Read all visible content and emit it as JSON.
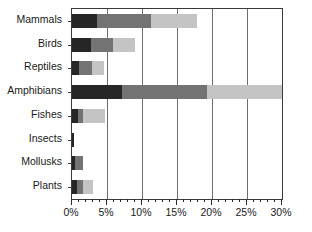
{
  "chart_data": {
    "type": "bar",
    "orientation": "horizontal",
    "stacked": true,
    "title": "",
    "xlabel": "",
    "ylabel": "",
    "xlim": [
      0,
      30
    ],
    "xtick_labels": [
      "0%",
      "5%",
      "10%",
      "15%",
      "20%",
      "25%",
      "30%"
    ],
    "xticks": [
      0,
      5,
      10,
      15,
      20,
      25,
      30
    ],
    "minor_tick_step": 1,
    "grid": "vertical",
    "legend": "none",
    "categories": [
      "Mammals",
      "Birds",
      "Reptiles",
      "Amphibians",
      "Fishes",
      "Insects",
      "Mollusks",
      "Plants"
    ],
    "series": [
      {
        "name": "series-1",
        "color": "#262626",
        "values": [
          3.6,
          2.7,
          1.0,
          7.1,
          0.9,
          0.3,
          0.4,
          0.7
        ]
      },
      {
        "name": "series-2",
        "color": "#737373",
        "values": [
          7.7,
          3.1,
          1.9,
          12.2,
          0.7,
          0.0,
          1.2,
          0.9
        ]
      },
      {
        "name": "series-3",
        "color": "#c4c4c4",
        "values": [
          6.6,
          3.2,
          1.7,
          10.7,
          3.1,
          0.0,
          0.0,
          1.4
        ]
      }
    ],
    "totals": [
      17.9,
      9.0,
      4.6,
      30.0,
      4.7,
      0.3,
      1.6,
      3.0
    ]
  },
  "colors": {
    "axis": "#3a3a3a",
    "gridline": "#6e6e6e",
    "background": "#ffffff",
    "text": "#1a1a1a"
  }
}
